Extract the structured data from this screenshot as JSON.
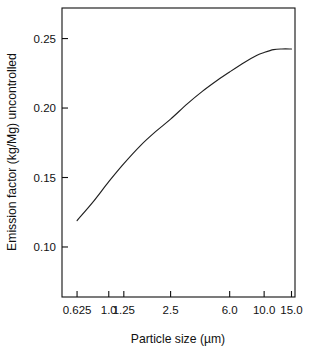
{
  "chart_data": {
    "type": "line",
    "title": "",
    "xlabel": "Particle size (µm)",
    "ylabel": "Emission factor (kg/Mg) uncontrolled",
    "x_tick_labels": [
      "0.625",
      "1.0",
      "1.25",
      "2.5",
      "6.0",
      "10.0",
      "15.0"
    ],
    "x_tick_values": [
      0.625,
      1.0,
      1.25,
      2.5,
      6.0,
      10.0,
      15.0
    ],
    "y_tick_labels": [
      "0.10",
      "0.15",
      "0.20",
      "0.25"
    ],
    "y_tick_values": [
      0.1,
      0.15,
      0.2,
      0.25
    ],
    "xlim": [
      0.5,
      15.8
    ],
    "ylim": [
      0.064,
      0.272
    ],
    "grid": false,
    "legend": null,
    "scale": {
      "x": "log",
      "y": "linear"
    },
    "series": [
      {
        "name": "Uncontrolled emission factor",
        "x": [
          0.625,
          0.8,
          1.0,
          1.25,
          1.6,
          2.0,
          2.5,
          3.2,
          4.0,
          5.0,
          6.0,
          7.5,
          9.0,
          10.0,
          11.5,
          13.0,
          15.0
        ],
        "values": [
          0.119,
          0.133,
          0.147,
          0.16,
          0.173,
          0.183,
          0.192,
          0.203,
          0.212,
          0.22,
          0.226,
          0.233,
          0.238,
          0.24,
          0.242,
          0.2425,
          0.2425
        ]
      }
    ]
  },
  "axis_titles": {
    "x": "Particle size (µm)",
    "y": "Emission factor (kg/Mg) uncontrolled"
  },
  "colors": {
    "curve": "#202020",
    "axis": "#101010",
    "background": "#ffffff"
  }
}
